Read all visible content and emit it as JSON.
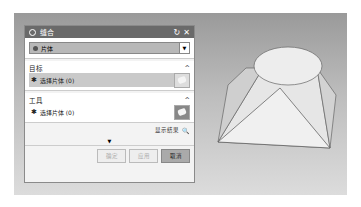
{
  "dialog": {
    "title": "缝合",
    "reset_icon": "reset-icon",
    "close_icon": "close-icon",
    "type_select": {
      "value": "片体",
      "icon": "sheet-icon"
    },
    "sections": [
      {
        "title": "目标",
        "item_label": "选择片体 (0)",
        "selected": true
      },
      {
        "title": "工具",
        "item_label": "选择片体 (0)",
        "selected": false
      }
    ],
    "preview_label": "显示结果",
    "buttons": {
      "ok": "确定",
      "apply": "应用",
      "cancel": "取消"
    }
  }
}
